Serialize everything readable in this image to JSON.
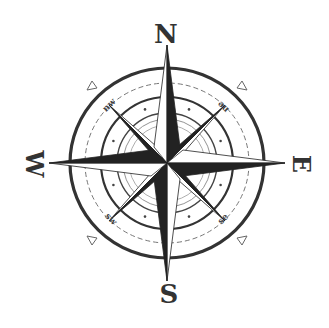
{
  "compass": {
    "cardinals": {
      "north": "N",
      "east": "E",
      "south": "S",
      "west": "W"
    },
    "intercardinals": {
      "northwest": "nw",
      "northeast": "ne",
      "southwest": "sw",
      "southeast": "se"
    },
    "colors": {
      "ink": "#2a2a2a",
      "ring_light": "#7a7a7a",
      "background": "#ffffff"
    }
  }
}
